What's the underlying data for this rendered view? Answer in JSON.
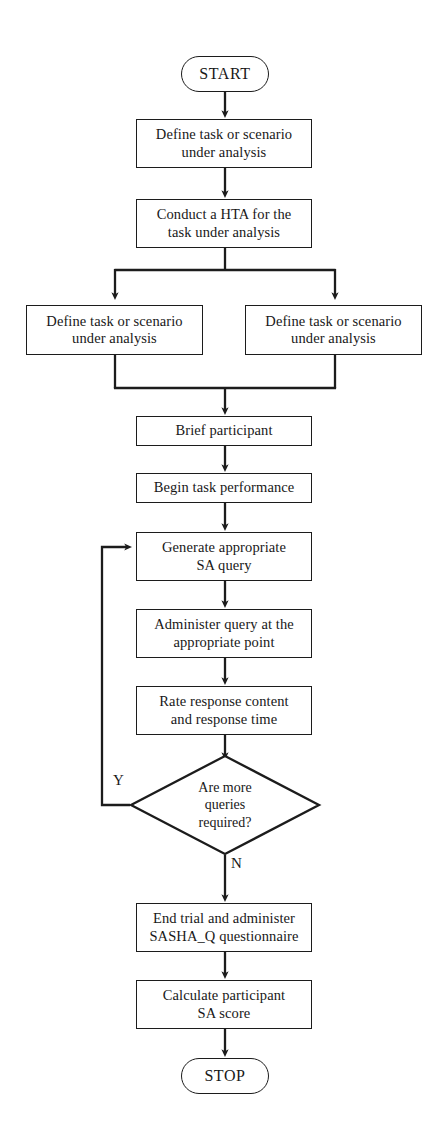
{
  "diagram": {
    "orientation": "top-to-bottom",
    "background_color": "#ffffff",
    "line_color": "#1c1c1c",
    "text_color": "#181818"
  },
  "nodes": {
    "start": {
      "label": "START",
      "shape": "terminator"
    },
    "define_task_1": {
      "line1": "Define task or scenario",
      "line2": "under analysis",
      "shape": "process"
    },
    "conduct_hta": {
      "line1": "Conduct a HTA for the",
      "line2": "task under analysis",
      "shape": "process"
    },
    "define_task_left": {
      "line1": "Define task or scenario",
      "line2": "under analysis",
      "shape": "process"
    },
    "define_task_right": {
      "line1": "Define task or scenario",
      "line2": "under analysis",
      "shape": "process"
    },
    "brief_participant": {
      "line1": "Brief participant",
      "shape": "process"
    },
    "begin_task": {
      "line1": "Begin task performance",
      "shape": "process"
    },
    "generate_query": {
      "line1": "Generate appropriate",
      "line2": "SA query",
      "shape": "process"
    },
    "administer_query": {
      "line1": "Administer query at the",
      "line2": "appropriate point",
      "shape": "process"
    },
    "rate_response": {
      "line1": "Rate response content",
      "line2": "and response time",
      "shape": "process"
    },
    "decision_more_queries": {
      "line1": "Are more",
      "line2": "queries",
      "line3": "required?",
      "shape": "decision",
      "yes_label": "Y",
      "no_label": "N"
    },
    "end_trial": {
      "line1": "End trial and administer",
      "line2": "SASHA_Q questionnaire",
      "shape": "process"
    },
    "calculate_sa": {
      "line1": "Calculate participant",
      "line2": "SA score",
      "shape": "process"
    },
    "stop": {
      "label": "STOP",
      "shape": "terminator"
    }
  },
  "edges": [
    {
      "from": "start",
      "to": "define_task_1",
      "type": "arrow"
    },
    {
      "from": "define_task_1",
      "to": "conduct_hta",
      "type": "arrow"
    },
    {
      "from": "conduct_hta",
      "to": "split",
      "type": "arrow"
    },
    {
      "from": "split",
      "to": "define_task_left",
      "type": "arrow"
    },
    {
      "from": "split",
      "to": "define_task_right",
      "type": "arrow"
    },
    {
      "from": "merge",
      "to": "brief_participant",
      "type": "arrow"
    },
    {
      "from": "brief_participant",
      "to": "begin_task",
      "type": "arrow"
    },
    {
      "from": "begin_task",
      "to": "generate_query",
      "type": "arrow"
    },
    {
      "from": "generate_query",
      "to": "administer_query",
      "type": "arrow"
    },
    {
      "from": "administer_query",
      "to": "rate_response",
      "type": "arrow"
    },
    {
      "from": "rate_response",
      "to": "decision_more_queries",
      "type": "arrow"
    },
    {
      "from": "decision_more_queries",
      "to": "generate_query",
      "type": "arrow",
      "label": "Y"
    },
    {
      "from": "decision_more_queries",
      "to": "end_trial",
      "type": "arrow",
      "label": "N"
    },
    {
      "from": "end_trial",
      "to": "calculate_sa",
      "type": "arrow"
    },
    {
      "from": "calculate_sa",
      "to": "stop",
      "type": "arrow"
    }
  ]
}
